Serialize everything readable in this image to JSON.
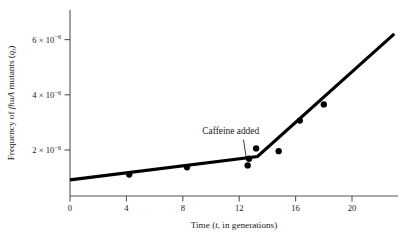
{
  "chart_data": {
    "type": "scatter",
    "title": "",
    "xlabel_parts": {
      "prefix": "Time (",
      "italic": "t",
      "suffix": ", in generations)"
    },
    "ylabel_parts": {
      "prefix": "Frequency of ",
      "italic": "fhuA",
      "mid": " mutants (",
      "sub_base": "q",
      "sub_script": "t",
      "suffix": ")"
    },
    "xlabel": "Time (t, in generations)",
    "ylabel": "Frequency of fhuA mutants (qt)",
    "xlim": [
      0,
      23.5
    ],
    "ylim": [
      0,
      7.3e-06
    ],
    "xticks": [
      0,
      4,
      8,
      12,
      16,
      20
    ],
    "xtick_labels": [
      "0",
      "4",
      "8",
      "12",
      "16",
      "20"
    ],
    "yticks": [
      2e-06,
      4e-06,
      6e-06
    ],
    "ytick_labels": [
      "2 × 10−6",
      "4 × 10−6",
      "6 × 10−6"
    ],
    "ytick_mantissas": [
      "2",
      "4",
      "6"
    ],
    "ytick_exponent": "−6",
    "ytick_base": "10",
    "ytick_times": "×",
    "grid": false,
    "legend": null,
    "points": [
      {
        "x": 4.2,
        "y": 9.3e-07
      },
      {
        "x": 8.3,
        "y": 1.25e-06
      },
      {
        "x": 12.6,
        "y": 1.33e-06
      },
      {
        "x": 12.7,
        "y": 1.62e-06
      },
      {
        "x": 13.2,
        "y": 2.07e-06
      },
      {
        "x": 14.8,
        "y": 1.95e-06
      },
      {
        "x": 16.3,
        "y": 3.28e-06
      },
      {
        "x": 18.0,
        "y": 3.98e-06
      }
    ],
    "fit_line": {
      "label": "piecewise-linear trend",
      "vertices": [
        {
          "x": 0.0,
          "y": 7e-07
        },
        {
          "x": 13.3,
          "y": 1.72e-06
        },
        {
          "x": 23.0,
          "y": 7.05e-06
        }
      ],
      "color": "#000000"
    },
    "annotations": [
      {
        "text": "Caffeine added",
        "text_x": 11.4,
        "text_y": 2.7e-06,
        "leader_from": {
          "x": 12.3,
          "y": 2.45e-06
        },
        "leader_to": {
          "x": 12.5,
          "y": 1.66e-06
        }
      }
    ],
    "axis_color": "#555555",
    "point_color": "#000000",
    "background": "#ffffff"
  }
}
